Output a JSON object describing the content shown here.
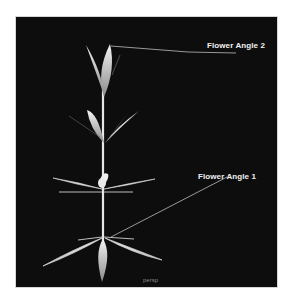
{
  "viewport": {
    "camera_label": "persp",
    "background_color": "#0d0d0d"
  },
  "annotations": [
    {
      "label": "Flower Angle 2"
    },
    {
      "label": "Flower Angle 1"
    }
  ],
  "colors": {
    "leaf_light": "#f4f4f4",
    "leaf_dark": "#7a7a7a",
    "leader_line": "#bdbdbd",
    "text": "#f2f2f2"
  }
}
